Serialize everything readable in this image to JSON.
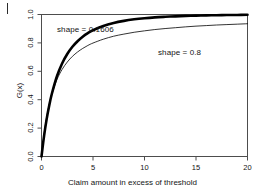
{
  "chart_data": {
    "type": "line",
    "title": "",
    "xlabel": "Claim amount in excess of threshold",
    "ylabel": "G(x)",
    "xlim": [
      0,
      20
    ],
    "ylim": [
      0.0,
      1.0
    ],
    "xticks": [
      "0",
      "5",
      "10",
      "15",
      "20"
    ],
    "xtick_values": [
      0,
      5,
      10,
      15,
      20
    ],
    "yticks": [
      "0.0",
      "0.2",
      "0.4",
      "0.6",
      "0.8",
      "1.0"
    ],
    "ytick_values": [
      0.0,
      0.2,
      0.4,
      0.6,
      0.8,
      1.0
    ],
    "grid": false,
    "legend": "annotations-inline",
    "frame": "box",
    "series": [
      {
        "name": "shape = 0.1606",
        "annotation": "shape = 0.1606",
        "linewidth": "thick",
        "color": "#000000",
        "x": [
          0,
          0.25,
          0.5,
          0.75,
          1,
          1.5,
          2,
          2.5,
          3,
          3.5,
          4,
          4.5,
          5,
          6,
          7,
          8,
          9,
          10,
          11,
          12,
          13,
          14,
          15,
          16,
          17,
          18,
          19,
          20
        ],
        "values": [
          0.0,
          0.145,
          0.263,
          0.359,
          0.44,
          0.565,
          0.655,
          0.722,
          0.773,
          0.812,
          0.844,
          0.869,
          0.889,
          0.919,
          0.94,
          0.955,
          0.966,
          0.974,
          0.98,
          0.984,
          0.987,
          0.99,
          0.992,
          0.994,
          0.995,
          0.996,
          0.997,
          0.998
        ]
      },
      {
        "name": "shape = 0.8",
        "annotation": "shape = 0.8",
        "linewidth": "thin",
        "color": "#000000",
        "x": [
          0,
          0.25,
          0.5,
          0.75,
          1,
          1.5,
          2,
          2.5,
          3,
          3.5,
          4,
          4.5,
          5,
          6,
          7,
          8,
          9,
          10,
          11,
          12,
          13,
          14,
          15,
          16,
          17,
          18,
          19,
          20
        ],
        "values": [
          0.0,
          0.158,
          0.276,
          0.366,
          0.438,
          0.542,
          0.613,
          0.665,
          0.705,
          0.736,
          0.761,
          0.782,
          0.799,
          0.826,
          0.847,
          0.862,
          0.875,
          0.885,
          0.894,
          0.901,
          0.907,
          0.913,
          0.918,
          0.922,
          0.926,
          0.929,
          0.932,
          0.935
        ]
      }
    ]
  }
}
